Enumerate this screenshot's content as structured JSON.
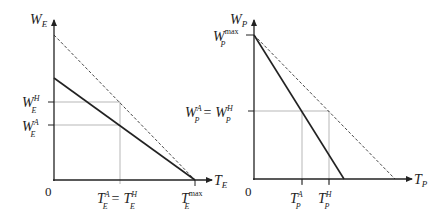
{
  "left_panel": {
    "y_axis_label": "W",
    "y_axis_sub": "E",
    "x_axis_label": "T",
    "x_axis_sub": "E",
    "origin": "0",
    "y_ticks": [
      {
        "main": "W",
        "sub": "E",
        "sup": "H"
      },
      {
        "main": "W",
        "sub": "E",
        "sup": "A"
      }
    ],
    "x_ticks": [
      {
        "text_left_main": "T",
        "text_left_sub": "E",
        "text_left_sup": "A",
        "eq": "=",
        "text_right_main": "T",
        "text_right_sub": "E",
        "text_right_sup": "H"
      },
      {
        "main": "T",
        "sub": "E",
        "sup": "max"
      }
    ],
    "lines": [
      {
        "name": "dashed-line",
        "style": "dashed"
      },
      {
        "name": "solid-line",
        "style": "solid"
      }
    ]
  },
  "right_panel": {
    "y_axis_label": "W",
    "y_axis_sub": "P",
    "x_axis_label": "T",
    "x_axis_sub": "P",
    "origin": "0",
    "y_ticks": [
      {
        "main": "W",
        "sub": "P",
        "sup": "max"
      },
      {
        "left_main": "W",
        "left_sub": "P",
        "left_sup": "A",
        "eq": "=",
        "right_main": "W",
        "right_sub": "P",
        "right_sup": "H"
      }
    ],
    "x_ticks": [
      {
        "main": "T",
        "sub": "P",
        "sup": "A"
      },
      {
        "main": "T",
        "sub": "P",
        "sup": "H"
      }
    ],
    "lines": [
      {
        "name": "dashed-line",
        "style": "dashed"
      },
      {
        "name": "solid-line",
        "style": "solid"
      }
    ]
  }
}
